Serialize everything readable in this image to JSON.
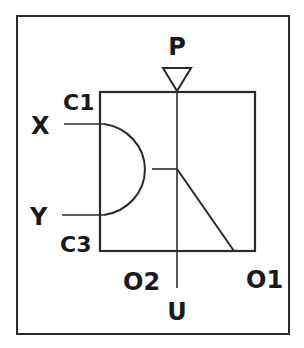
{
  "diagram": {
    "type": "pneumatic-logic-symbol",
    "colors": {
      "stroke": "#2a2a2a",
      "text": "#1a1a1a",
      "background": "#ffffff"
    },
    "labels": {
      "supply": "P",
      "input_x": "X",
      "input_y": "Y",
      "control_1": "C1",
      "control_3": "C3",
      "output_2": "O2",
      "output_1": "O1",
      "exhaust": "U"
    }
  }
}
